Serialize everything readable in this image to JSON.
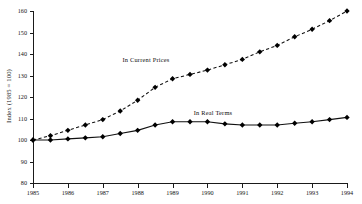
{
  "chart_data": {
    "type": "line",
    "title": "",
    "xlabel": "",
    "ylabel": "Index (1985 = 100)",
    "xlim": [
      1985,
      1994
    ],
    "ylim": [
      80,
      160
    ],
    "grid": false,
    "legend_position": "inline-annotation",
    "xticks": [
      "1985",
      "1986",
      "1987",
      "1988",
      "1989",
      "1990",
      "1991",
      "1992",
      "1993",
      "1994"
    ],
    "yticks": [
      "80",
      "90",
      "100",
      "110",
      "120",
      "130",
      "140",
      "150",
      "160"
    ],
    "x": [
      1985,
      1985.5,
      1986,
      1986.5,
      1987,
      1987.5,
      1988,
      1988.5,
      1989,
      1989.5,
      1990,
      1990.5,
      1991,
      1991.5,
      1992,
      1992.5,
      1993,
      1993.5,
      1994
    ],
    "series": [
      {
        "name": "In Current Prices",
        "style": "dashed",
        "marker": "filled-diamond",
        "annotation": "In Current Prices",
        "values": [
          100.0,
          102.0,
          104.5,
          107.0,
          109.5,
          113.5,
          118.5,
          124.5,
          128.5,
          130.5,
          132.5,
          135.0,
          137.5,
          141.0,
          144.0,
          148.0,
          151.5,
          155.5,
          160.0
        ]
      },
      {
        "name": "In Real Terms",
        "style": "solid",
        "marker": "filled-diamond",
        "annotation": "In Real Terms",
        "values": [
          100.0,
          100.0,
          100.5,
          101.0,
          101.5,
          103.0,
          104.5,
          107.0,
          108.5,
          108.5,
          108.5,
          107.5,
          107.0,
          107.0,
          107.0,
          107.8,
          108.5,
          109.5,
          110.5
        ]
      }
    ]
  },
  "annotations": {
    "current_prices_label": "In Current Prices",
    "real_terms_label": "In Real Terms"
  },
  "colors": {
    "line": "#111111",
    "axis": "#1a1a1a",
    "background": "#ffffff",
    "text": "#151515"
  }
}
